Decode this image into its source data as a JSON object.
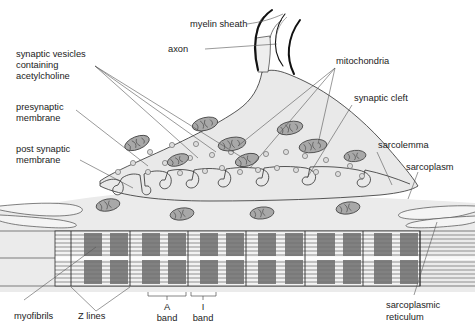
{
  "figure": {
    "background": "#ffffff"
  },
  "colors": {
    "cytoplasm_fill": "#e9e9e9",
    "muscle_fill": "#ebebeb",
    "mitochondria_fill": "#a8a8a8",
    "mitochondria_stroke": "#4a4a4a",
    "vesicle_fill": "#dcdcdc",
    "vesicle_stroke": "#5a5a5a",
    "myelin_stroke": "#111111",
    "outline_stroke": "#3a3a3a",
    "band_dark": "#6d6d6d",
    "band_mid": "#8f8f8f",
    "sarcomere_fill": "#f2f2f2",
    "leader_stroke": "#555555",
    "text": "#1b1b1b"
  },
  "labels": {
    "myelin_sheath": "myelin sheath",
    "axon": "axon",
    "synaptic_vesicles_l1": "synaptic vesicles",
    "synaptic_vesicles_l2": "containing",
    "synaptic_vesicles_l3": "acetylcholine",
    "presynaptic_l1": "presynaptic",
    "presynaptic_l2": "membrane",
    "postsynaptic_l1": "post synaptic",
    "postsynaptic_l2": "membrane",
    "mitochondria": "mitochondria",
    "synaptic_cleft": "synaptic cleft",
    "sarcolemma": "sarcolemma",
    "sarcoplasm": "sarcoplasm",
    "myofibrils": "myofibrils",
    "z_lines": "Z lines",
    "a_band_l1": "A",
    "a_band_l2": "band",
    "i_band_l1": "I",
    "i_band_l2": "band",
    "sarcoplasmic_reticulum_l1": "sarcoplasmic",
    "sarcoplasmic_reticulum_l2": "reticulum"
  },
  "structures": {
    "sarcomere_count": 5,
    "myofibril_row_count": 2,
    "z_line_positions_px": [
      188,
      246,
      305,
      363,
      420
    ],
    "mitochondria_count_terminal": 8,
    "mitochondria_count_sarcoplasm": 4,
    "vesicle_count": 26,
    "junctional_fold_count": 7
  },
  "icons": {
    "mitochondrion": "mitochondrion-icon",
    "vesicle": "vesicle-icon",
    "z_line": "z-line-icon",
    "band_bracket": "bracket-icon"
  }
}
